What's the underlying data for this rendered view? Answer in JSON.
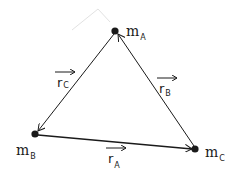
{
  "diagram": {
    "title": "",
    "masses": [
      {
        "id": "A",
        "label": "m",
        "subscript": "A",
        "x": 115,
        "y": 31
      },
      {
        "id": "B",
        "label": "m",
        "subscript": "B",
        "x": 35,
        "y": 134
      },
      {
        "id": "C",
        "label": "m",
        "subscript": "C",
        "x": 195,
        "y": 149
      }
    ],
    "vectors": [
      {
        "id": "rA",
        "label": "r",
        "subscript": "A",
        "from": "B",
        "to": "C"
      },
      {
        "id": "rB",
        "label": "r",
        "subscript": "B",
        "from": "C",
        "to": "A"
      },
      {
        "id": "rC",
        "label": "r",
        "subscript": "C",
        "from": "A",
        "to": "B"
      }
    ],
    "colors": {
      "ink": "#1a1a1a",
      "faint": "#dddddd",
      "background": "#ffffff"
    }
  }
}
